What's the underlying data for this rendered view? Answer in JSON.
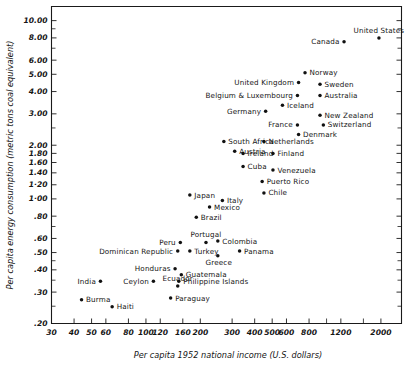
{
  "chart_data": {
    "type": "scatter",
    "title": "",
    "xlabel": "Per capita 1952  national  income (U.S. dollars)",
    "ylabel": "Per capita energy consumption (metric tons coal  equivalent)",
    "xscale": "log",
    "yscale": "log",
    "xlim": [
      30,
      2600
    ],
    "ylim": [
      0.2,
      12.0
    ],
    "grid": false,
    "legend": "none",
    "xticks": [
      {
        "value": 30,
        "label": "30"
      },
      {
        "value": 40,
        "label": "40"
      },
      {
        "value": 50,
        "label": "50"
      },
      {
        "value": 60,
        "label": "60"
      },
      {
        "value": 80,
        "label": "80"
      },
      {
        "value": 100,
        "label": "100"
      },
      {
        "value": 120,
        "label": "120"
      },
      {
        "value": 160,
        "label": "160"
      },
      {
        "value": 200,
        "label": "200"
      },
      {
        "value": 300,
        "label": "300"
      },
      {
        "value": 400,
        "label": "400"
      },
      {
        "value": 500,
        "label": "500"
      },
      {
        "value": 600,
        "label": "600"
      },
      {
        "value": 800,
        "label": "800"
      },
      {
        "value": 1200,
        "label": "1200"
      },
      {
        "value": 2000,
        "label": "2000"
      }
    ],
    "xticks_minor": [
      1000,
      1600,
      2600
    ],
    "yticks": [
      {
        "value": 10.0,
        "label": "10.00"
      },
      {
        "value": 8.0,
        "label": "8.00"
      },
      {
        "value": 6.0,
        "label": "6.00"
      },
      {
        "value": 5.0,
        "label": "5.00"
      },
      {
        "value": 4.0,
        "label": "4.00"
      },
      {
        "value": 3.0,
        "label": "3.00"
      },
      {
        "value": 2.0,
        "label": "2.00"
      },
      {
        "value": 1.8,
        "label": "1.80"
      },
      {
        "value": 1.6,
        "label": "1.60"
      },
      {
        "value": 1.4,
        "label": "1.40"
      },
      {
        "value": 1.2,
        "label": "1·20"
      },
      {
        "value": 1.0,
        "label": "1·00"
      },
      {
        "value": 0.8,
        "label": ".80"
      },
      {
        "value": 0.6,
        "label": ".60"
      },
      {
        "value": 0.5,
        "label": ".50"
      },
      {
        "value": 0.4,
        "label": ".40"
      },
      {
        "value": 0.3,
        "label": ".30"
      },
      {
        "value": 0.2,
        "label": ".20"
      }
    ],
    "yticks_minor": [
      2.5,
      7.0,
      9.0,
      0.7,
      0.45,
      0.35,
      0.25
    ],
    "points": [
      {
        "label": "United States",
        "x": 1950,
        "y": 8.0,
        "pos": "above"
      },
      {
        "label": "Canada",
        "x": 1250,
        "y": 7.6,
        "pos": "left"
      },
      {
        "label": "Norway",
        "x": 760,
        "y": 5.1,
        "pos": "right"
      },
      {
        "label": "United Kingdom",
        "x": 700,
        "y": 4.5,
        "pos": "left"
      },
      {
        "label": "Sweden",
        "x": 920,
        "y": 4.4,
        "pos": "right"
      },
      {
        "label": "Belgium & Luxembourg",
        "x": 690,
        "y": 3.8,
        "pos": "left"
      },
      {
        "label": "Australia",
        "x": 920,
        "y": 3.8,
        "pos": "right"
      },
      {
        "label": "Iceland",
        "x": 570,
        "y": 3.35,
        "pos": "right"
      },
      {
        "label": "Germany",
        "x": 460,
        "y": 3.1,
        "pos": "left"
      },
      {
        "label": "New Zealand",
        "x": 920,
        "y": 2.95,
        "pos": "right"
      },
      {
        "label": "France",
        "x": 690,
        "y": 2.6,
        "pos": "left"
      },
      {
        "label": "Switzerland",
        "x": 960,
        "y": 2.6,
        "pos": "right"
      },
      {
        "label": "Denmark",
        "x": 700,
        "y": 2.3,
        "pos": "right"
      },
      {
        "label": "South Africa",
        "x": 270,
        "y": 2.1,
        "pos": "right"
      },
      {
        "label": "Netherlands",
        "x": 450,
        "y": 2.1,
        "pos": "right"
      },
      {
        "label": "Austria",
        "x": 310,
        "y": 1.85,
        "pos": "right"
      },
      {
        "label": "Ireland",
        "x": 345,
        "y": 1.8,
        "pos": "right"
      },
      {
        "label": "Finland",
        "x": 505,
        "y": 1.8,
        "pos": "right"
      },
      {
        "label": "Cuba",
        "x": 345,
        "y": 1.52,
        "pos": "right"
      },
      {
        "label": "Venezuela",
        "x": 505,
        "y": 1.45,
        "pos": "right"
      },
      {
        "label": "Puerto Rico",
        "x": 440,
        "y": 1.25,
        "pos": "right"
      },
      {
        "label": "Chile",
        "x": 450,
        "y": 1.08,
        "pos": "right"
      },
      {
        "label": "Japan",
        "x": 175,
        "y": 1.05,
        "pos": "right"
      },
      {
        "label": "Italy",
        "x": 265,
        "y": 0.98,
        "pos": "right"
      },
      {
        "label": "Mexico",
        "x": 225,
        "y": 0.9,
        "pos": "right"
      },
      {
        "label": "Brazil",
        "x": 190,
        "y": 0.79,
        "pos": "right"
      },
      {
        "label": "Portugal",
        "x": 215,
        "y": 0.57,
        "pos": "above"
      },
      {
        "label": "Colombia",
        "x": 250,
        "y": 0.58,
        "pos": "right"
      },
      {
        "label": "Peru",
        "x": 155,
        "y": 0.57,
        "pos": "left"
      },
      {
        "label": "Dominican Republic",
        "x": 150,
        "y": 0.51,
        "pos": "left"
      },
      {
        "label": "Turkey",
        "x": 175,
        "y": 0.51,
        "pos": "right"
      },
      {
        "label": "Panama",
        "x": 330,
        "y": 0.51,
        "pos": "right"
      },
      {
        "label": "Greece",
        "x": 250,
        "y": 0.48,
        "pos": "below"
      },
      {
        "label": "Honduras",
        "x": 145,
        "y": 0.405,
        "pos": "left"
      },
      {
        "label": "Guatemala",
        "x": 157,
        "y": 0.375,
        "pos": "right"
      },
      {
        "label": "Philippine Islands",
        "x": 152,
        "y": 0.345,
        "pos": "right"
      },
      {
        "label": "India",
        "x": 56,
        "y": 0.345,
        "pos": "left"
      },
      {
        "label": "Ceylon",
        "x": 110,
        "y": 0.345,
        "pos": "left"
      },
      {
        "label": "Ecuador",
        "x": 150,
        "y": 0.325,
        "pos": "above"
      },
      {
        "label": "Paraguay",
        "x": 137,
        "y": 0.278,
        "pos": "right"
      },
      {
        "label": "Burma",
        "x": 44,
        "y": 0.272,
        "pos": "right"
      },
      {
        "label": "Haiti",
        "x": 65,
        "y": 0.248,
        "pos": "right"
      }
    ]
  }
}
